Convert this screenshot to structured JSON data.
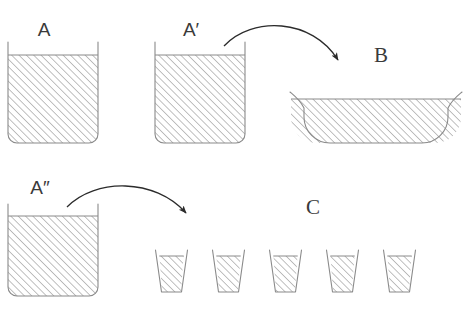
{
  "figure": {
    "background_color": "#ffffff",
    "line_color": "#8a8a8a",
    "arrow_color": "#2b2b2b",
    "hatch_color": "#9a9a9a",
    "label_color": "#3a3a3a"
  },
  "labels": {
    "a": "A",
    "a_prime": "A′",
    "a_double_prime": "A″",
    "b": "B",
    "c": "C"
  },
  "vessels": {
    "container_a": {
      "name": "A",
      "kind": "square-container",
      "x": 8,
      "y": 42,
      "width": 90,
      "height": 101,
      "fill_level_y": 55,
      "corner_radius": 9
    },
    "container_a_prime": {
      "name": "A′",
      "kind": "square-container",
      "x": 155,
      "y": 42,
      "width": 90,
      "height": 101,
      "fill_level_y": 55,
      "corner_radius": 9
    },
    "container_a_double_prime": {
      "name": "A″",
      "kind": "square-container",
      "x": 8,
      "y": 204,
      "width": 90,
      "height": 92,
      "fill_level_y": 216,
      "corner_radius": 9
    },
    "bowl_b": {
      "name": "B",
      "kind": "wide-shallow-bowl",
      "x": 290,
      "y": 92,
      "width": 172,
      "height": 51,
      "fill_level_y": 99,
      "corner_radius": 26
    },
    "cups_c": {
      "name": "C",
      "kind": "small-tapered-cups",
      "count": 5,
      "top_width": 33,
      "bottom_width": 24,
      "height": 42,
      "top_y": 250,
      "bottom_y": 292,
      "fill_level_y": 256,
      "left_edges": [
        155,
        212,
        269,
        326,
        383
      ]
    }
  },
  "arrows": [
    {
      "name": "arrow-a-prime-to-b",
      "from": "A′",
      "to": "B",
      "start_x": 224,
      "start_y": 46,
      "end_x": 341,
      "end_y": 67
    },
    {
      "name": "arrow-a-double-prime-to-c",
      "from": "A″",
      "to": "C",
      "start_x": 67,
      "start_y": 207,
      "end_x": 189,
      "end_y": 220
    }
  ],
  "label_positions": {
    "a": {
      "x": 44,
      "y": 36
    },
    "a_prime": {
      "x": 191,
      "y": 36
    },
    "a_double_prime": {
      "x": 40,
      "y": 194
    },
    "b": {
      "x": 381,
      "y": 62
    },
    "c": {
      "x": 313,
      "y": 214
    }
  }
}
